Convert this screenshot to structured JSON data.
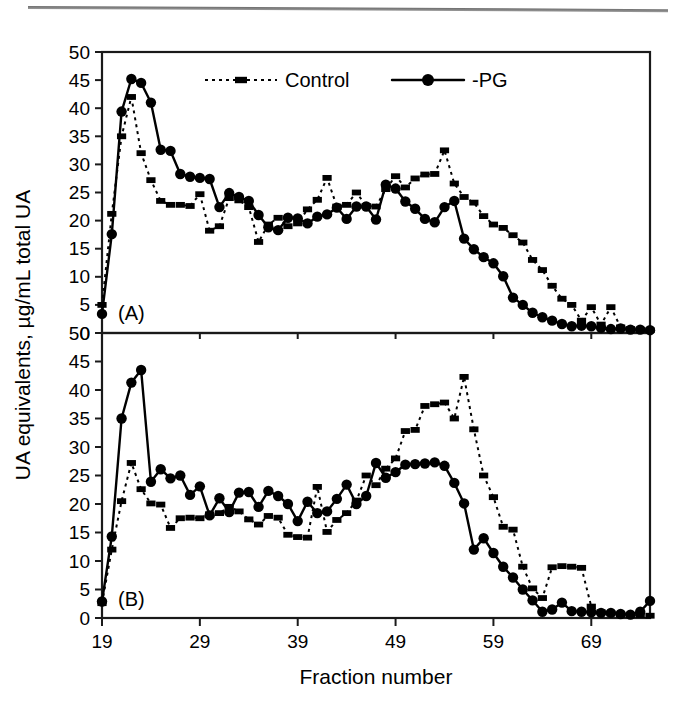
{
  "figure": {
    "y_axis_title": "UA equivalents, µg/mL total UA",
    "x_axis_title": "Fraction number",
    "panel_a_tag": "(A)",
    "panel_b_tag": "(B)"
  },
  "legend": {
    "position": "top-center of panel A",
    "entries": [
      {
        "label": "Control",
        "marker": "square",
        "line": "dotted",
        "color": "#000000"
      },
      {
        "label": "-PG",
        "marker": "circle",
        "line": "solid",
        "color": "#000000"
      }
    ]
  },
  "axes": {
    "x_ticks": [
      "19",
      "29",
      "39",
      "49",
      "59",
      "69"
    ],
    "x_tick_values": [
      19,
      29,
      39,
      49,
      59,
      69
    ],
    "y_ticks_panel_a": [
      "50",
      "45",
      "40",
      "35",
      "30",
      "25",
      "20",
      "15",
      "10",
      "5",
      "0"
    ],
    "y_ticks_panel_b": [
      "50",
      "45",
      "40",
      "35",
      "30",
      "25",
      "20",
      "15",
      "10",
      "5",
      "0"
    ],
    "y_tick_values": [
      50,
      45,
      40,
      35,
      30,
      25,
      20,
      15,
      10,
      5,
      0
    ],
    "xlim": [
      19,
      75
    ],
    "ylim": [
      0,
      50
    ]
  },
  "chart_data": [
    {
      "type": "line",
      "panel": "(A)",
      "title": "",
      "xlabel": "Fraction number",
      "ylabel": "UA equivalents, µg/mL total UA",
      "xlim": [
        19,
        75
      ],
      "ylim": [
        0,
        50
      ],
      "grid": false,
      "legend_position": "top-center",
      "x": [
        19,
        20,
        21,
        22,
        23,
        24,
        25,
        26,
        27,
        28,
        29,
        30,
        31,
        32,
        33,
        34,
        35,
        36,
        37,
        38,
        39,
        40,
        41,
        42,
        43,
        44,
        45,
        46,
        47,
        48,
        49,
        50,
        51,
        52,
        53,
        54,
        55,
        56,
        57,
        58,
        59,
        60,
        61,
        62,
        63,
        64,
        65,
        66,
        67,
        68,
        69,
        70,
        71,
        72,
        73,
        74,
        75
      ],
      "series": [
        {
          "name": "Control",
          "marker": "square",
          "linestyle": "dotted",
          "values": [
            5.0,
            21.2,
            35.0,
            42.0,
            32.0,
            27.2,
            23.5,
            22.8,
            22.8,
            22.6,
            24.7,
            18.2,
            19.0,
            24.0,
            23.6,
            22.4,
            16.2,
            19.3,
            20.5,
            19.0,
            19.5,
            22.0,
            23.7,
            27.6,
            22.5,
            22.8,
            25.0,
            22.6,
            22.5,
            25.6,
            27.9,
            25.9,
            27.5,
            28.2,
            28.3,
            32.5,
            26.6,
            24.2,
            23.2,
            20.8,
            19.3,
            18.7,
            17.4,
            16.1,
            13.0,
            11.2,
            8.4,
            6.1,
            5.0,
            2.2,
            4.6,
            1.5,
            4.6,
            1.0,
            0.7,
            0.6,
            0.5
          ]
        },
        {
          "name": "-PG",
          "marker": "circle",
          "linestyle": "solid",
          "values": [
            3.4,
            17.6,
            39.4,
            45.2,
            44.5,
            41.0,
            32.6,
            32.4,
            28.3,
            27.8,
            27.6,
            27.4,
            22.4,
            24.9,
            24.2,
            23.5,
            21.0,
            18.8,
            18.3,
            20.5,
            20.4,
            19.5,
            20.7,
            21.1,
            22.3,
            20.3,
            22.5,
            22.5,
            20.2,
            26.4,
            25.7,
            23.4,
            22.1,
            20.3,
            19.7,
            22.4,
            23.5,
            16.8,
            14.9,
            13.5,
            12.4,
            10.1,
            6.3,
            5.0,
            3.6,
            2.8,
            2.2,
            1.6,
            1.2,
            1.3,
            1.2,
            0.9,
            0.7,
            0.8,
            0.6,
            0.6,
            0.5
          ]
        }
      ]
    },
    {
      "type": "line",
      "panel": "(B)",
      "title": "",
      "xlabel": "Fraction number",
      "ylabel": "UA equivalents, µg/mL total UA",
      "xlim": [
        19,
        75
      ],
      "ylim": [
        0,
        50
      ],
      "grid": false,
      "legend_position": "none",
      "x": [
        19,
        20,
        21,
        22,
        23,
        24,
        25,
        26,
        27,
        28,
        29,
        30,
        31,
        32,
        33,
        34,
        35,
        36,
        37,
        38,
        39,
        40,
        41,
        42,
        43,
        44,
        45,
        46,
        47,
        48,
        49,
        50,
        51,
        52,
        53,
        54,
        55,
        56,
        57,
        58,
        59,
        60,
        61,
        62,
        63,
        64,
        65,
        66,
        67,
        68,
        69,
        70,
        71,
        72,
        73,
        74,
        75
      ],
      "series": [
        {
          "name": "Control",
          "marker": "square",
          "linestyle": "dotted",
          "values": [
            2.6,
            12.0,
            20.5,
            27.2,
            22.6,
            20.1,
            19.9,
            15.8,
            17.5,
            17.6,
            17.5,
            18.2,
            18.4,
            19.5,
            18.7,
            17.3,
            16.4,
            17.9,
            17.6,
            14.6,
            14.2,
            14.1,
            23.0,
            15.1,
            17.2,
            18.4,
            20.6,
            25.0,
            23.3,
            26.2,
            28.0,
            32.8,
            33.0,
            37.2,
            37.5,
            37.8,
            35.0,
            42.3,
            33.1,
            25.0,
            21.2,
            16.0,
            15.5,
            9.0,
            5.2,
            3.5,
            8.9,
            9.1,
            9.0,
            8.8,
            2.0,
            1.0,
            0.8,
            0.6,
            0.5,
            0.5,
            0.4
          ]
        },
        {
          "name": "-PG",
          "marker": "circle",
          "linestyle": "solid",
          "values": [
            2.9,
            14.3,
            35.0,
            41.3,
            43.5,
            23.9,
            26.1,
            24.5,
            25.0,
            21.6,
            23.1,
            18.0,
            21.0,
            18.6,
            22.0,
            22.1,
            19.5,
            22.3,
            21.4,
            20.0,
            17.0,
            20.4,
            18.4,
            18.7,
            20.9,
            23.4,
            20.0,
            21.4,
            27.2,
            24.6,
            25.6,
            26.9,
            27.0,
            27.1,
            27.3,
            26.7,
            23.7,
            20.1,
            12.0,
            14.0,
            11.4,
            9.0,
            7.1,
            5.0,
            3.1,
            1.1,
            1.5,
            2.7,
            1.2,
            1.1,
            1.0,
            0.9,
            0.9,
            0.7,
            0.6,
            1.1,
            3.0
          ]
        }
      ]
    }
  ]
}
